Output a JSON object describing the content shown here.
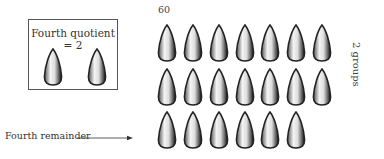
{
  "box": {
    "title": "Fourth quotient = 2",
    "cone_count": 2
  },
  "total_label": "60",
  "groups_label": "2 groups",
  "remainder_label": "Fourth remainder",
  "grid": {
    "rows": [
      {
        "count": 7
      },
      {
        "count": 7
      },
      {
        "count": 6
      }
    ]
  },
  "colors": {
    "ink": "#222222",
    "fill": "#f4f4f4"
  }
}
